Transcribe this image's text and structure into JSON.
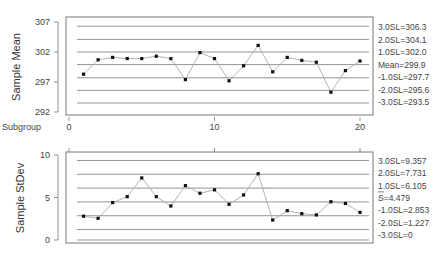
{
  "chart_data": [
    {
      "type": "line",
      "title": "",
      "ylabel": "Sample Mean",
      "xlabel": "Subgroup",
      "ylim": [
        292,
        307
      ],
      "xlim": [
        0,
        21
      ],
      "yticks": [
        "292",
        "297",
        "302",
        "307"
      ],
      "ytick_values": [
        292,
        297,
        302,
        307
      ],
      "xticks": [
        "0",
        "10",
        "20"
      ],
      "xtick_values": [
        0,
        10,
        20
      ],
      "x": [
        1,
        2,
        3,
        4,
        5,
        6,
        7,
        8,
        9,
        10,
        11,
        12,
        13,
        14,
        15,
        16,
        17,
        18,
        19,
        20
      ],
      "values": [
        298.3,
        300.7,
        301.1,
        300.9,
        300.9,
        301.3,
        300.9,
        297.4,
        301.9,
        300.9,
        297.2,
        299.7,
        303.1,
        298.7,
        301.1,
        300.6,
        300.3,
        295.3,
        298.9,
        300.5
      ],
      "grid": false,
      "reference_lines": [
        {
          "label": "3.0SL=306.3",
          "value": 306.3
        },
        {
          "label": "2.0SL=304.1",
          "value": 304.1
        },
        {
          "label": "1.0SL=302.0",
          "value": 302.0
        },
        {
          "label": "Mean=299.9",
          "value": 299.9
        },
        {
          "label": "-1.0SL=297.7",
          "value": 297.7
        },
        {
          "label": "-2.0SL=295.6",
          "value": 295.6
        },
        {
          "label": "-3.0SL=293.5",
          "value": 293.5
        }
      ]
    },
    {
      "type": "line",
      "title": "",
      "ylabel": "Sample StDev",
      "xlabel": "",
      "ylim": [
        0,
        10
      ],
      "xlim": [
        0,
        21
      ],
      "yticks": [
        "0",
        "5",
        "10"
      ],
      "ytick_values": [
        0,
        5,
        10
      ],
      "xticks": [],
      "xtick_values": [
        0,
        10,
        20
      ],
      "x": [
        1,
        2,
        3,
        4,
        5,
        6,
        7,
        8,
        9,
        10,
        11,
        12,
        13,
        14,
        15,
        16,
        17,
        18,
        19,
        20
      ],
      "values": [
        2.8,
        2.55,
        4.4,
        5.1,
        7.3,
        5.1,
        4.0,
        6.4,
        5.5,
        5.9,
        4.2,
        5.3,
        7.8,
        2.35,
        3.45,
        3.1,
        2.95,
        4.5,
        4.3,
        3.25
      ],
      "grid": false,
      "reference_lines": [
        {
          "label": "3.0SL=9.357",
          "value": 9.357
        },
        {
          "label": "2.0SL=7.731",
          "value": 7.731
        },
        {
          "label": "1.0SL=6.105",
          "value": 6.105
        },
        {
          "label": "S=4.479",
          "value": 4.479,
          "overbar": true
        },
        {
          "label": "-1.0SL=2.853",
          "value": 2.853
        },
        {
          "label": "-2.0SL=1.227",
          "value": 1.227
        },
        {
          "label": "-3.0SL=0",
          "value": 0
        }
      ]
    }
  ],
  "colors": {
    "line": "#aaaaaa",
    "point": "#111111",
    "ref_line": "#888888",
    "frame": "#777777",
    "text": "#444444"
  }
}
